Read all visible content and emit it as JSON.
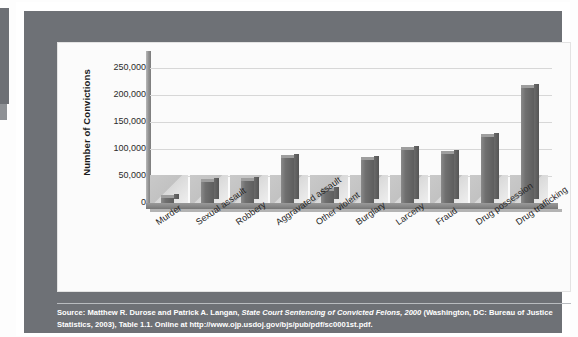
{
  "figure": {
    "caption_line1_pre": "Source: Matthew R. Durose and Patrick A. Langan, ",
    "caption_italic": "State Court Sentencing of Convicted Felons, 2000",
    "caption_line1_post": " (Washington, DC: Bureau of Justice Statistics,",
    "caption_line2": "2003), Table 1.1. Online at http://www.ojp.usdoj.gov/bjs/pub/pdf/sc0001st.pdf."
  },
  "colors": {
    "frame": "#6e7176",
    "panel": "#fbfbfb",
    "bar_fill": "#6f6f6f",
    "bar_shadow": "#c9c9c9",
    "gridline": "#d7d7d7",
    "axis": "#868686",
    "caption_text": "#ffffff"
  },
  "chart_data": {
    "type": "bar",
    "title": "",
    "xlabel": "",
    "ylabel": "Number of Convictions",
    "ylim": [
      0,
      275000
    ],
    "ytick_labels": [
      "250,000",
      "200,000",
      "150,000",
      "100,000",
      "50,000",
      "0"
    ],
    "ytick_values": [
      250000,
      200000,
      150000,
      100000,
      50000,
      0
    ],
    "grid": true,
    "legend": "none",
    "categories": [
      "Murder",
      "Sexual assault",
      "Robbery",
      "Aggravated assault",
      "Other violent",
      "Burglary",
      "Larceny",
      "Fraud",
      "Drug possession",
      "Drug trafficking"
    ],
    "values": [
      10000,
      38000,
      40000,
      83000,
      22000,
      80000,
      98000,
      90000,
      122000,
      212000
    ]
  }
}
